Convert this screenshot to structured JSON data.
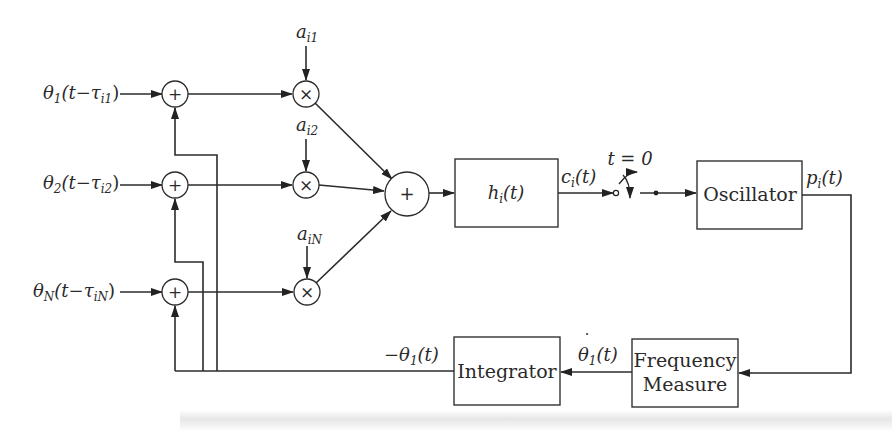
{
  "diagram": {
    "type": "block-diagram",
    "inputs": [
      {
        "id": "in1",
        "base": "θ",
        "sub": "1",
        "arg_open": "(t−τ",
        "arg_sub": "i1",
        "arg_close": ")"
      },
      {
        "id": "in2",
        "base": "θ",
        "sub": "2",
        "arg_open": "(t−τ",
        "arg_sub": "i2",
        "arg_close": ")"
      },
      {
        "id": "inN",
        "base": "θ",
        "sub": "N",
        "arg_open": "(t−τ",
        "arg_sub": "iN",
        "arg_close": ")"
      }
    ],
    "adders": [
      {
        "id": "sum1",
        "symbol": "+"
      },
      {
        "id": "sum2",
        "symbol": "+"
      },
      {
        "id": "sumN",
        "symbol": "+"
      },
      {
        "id": "sumMain",
        "symbol": "+"
      }
    ],
    "multipliers": [
      {
        "id": "mul1",
        "symbol": "×",
        "gain_base": "a",
        "gain_sub": "i1"
      },
      {
        "id": "mul2",
        "symbol": "×",
        "gain_base": "a",
        "gain_sub": "i2"
      },
      {
        "id": "mulN",
        "symbol": "×",
        "gain_base": "a",
        "gain_sub": "iN"
      }
    ],
    "blocks": {
      "filter": {
        "base": "h",
        "sub": "i",
        "arg": "(t)"
      },
      "oscillator": {
        "label": "Oscillator"
      },
      "frequency_measure": {
        "line1": "Frequency",
        "line2": "Measure"
      },
      "integrator": {
        "label": "Integrator"
      }
    },
    "switch": {
      "label": "t = 0"
    },
    "signals": {
      "filter_out": {
        "base": "c",
        "sub": "i",
        "arg": "(t)"
      },
      "osc_out": {
        "base": "p",
        "sub": "i",
        "arg": "(t)"
      },
      "freq_out": {
        "base": "θ",
        "dot": "˙",
        "sub": "1",
        "arg": "(t)"
      },
      "integ_out": {
        "prefix": "−",
        "base": "θ",
        "sub": "1",
        "arg": "(t)"
      }
    },
    "edges": [
      [
        "in1",
        "sum1"
      ],
      [
        "in2",
        "sum2"
      ],
      [
        "inN",
        "sumN"
      ],
      [
        "sum1",
        "mul1"
      ],
      [
        "sum2",
        "mul2"
      ],
      [
        "sumN",
        "mulN"
      ],
      [
        "mul1",
        "sumMain"
      ],
      [
        "mul2",
        "sumMain"
      ],
      [
        "mulN",
        "sumMain"
      ],
      [
        "sumMain",
        "filter"
      ],
      [
        "filter",
        "switch"
      ],
      [
        "switch",
        "oscillator"
      ],
      [
        "oscillator",
        "frequency_measure"
      ],
      [
        "frequency_measure",
        "integrator"
      ],
      [
        "integrator",
        "sum1"
      ],
      [
        "integrator",
        "sum2"
      ],
      [
        "integrator",
        "sumN"
      ]
    ]
  }
}
